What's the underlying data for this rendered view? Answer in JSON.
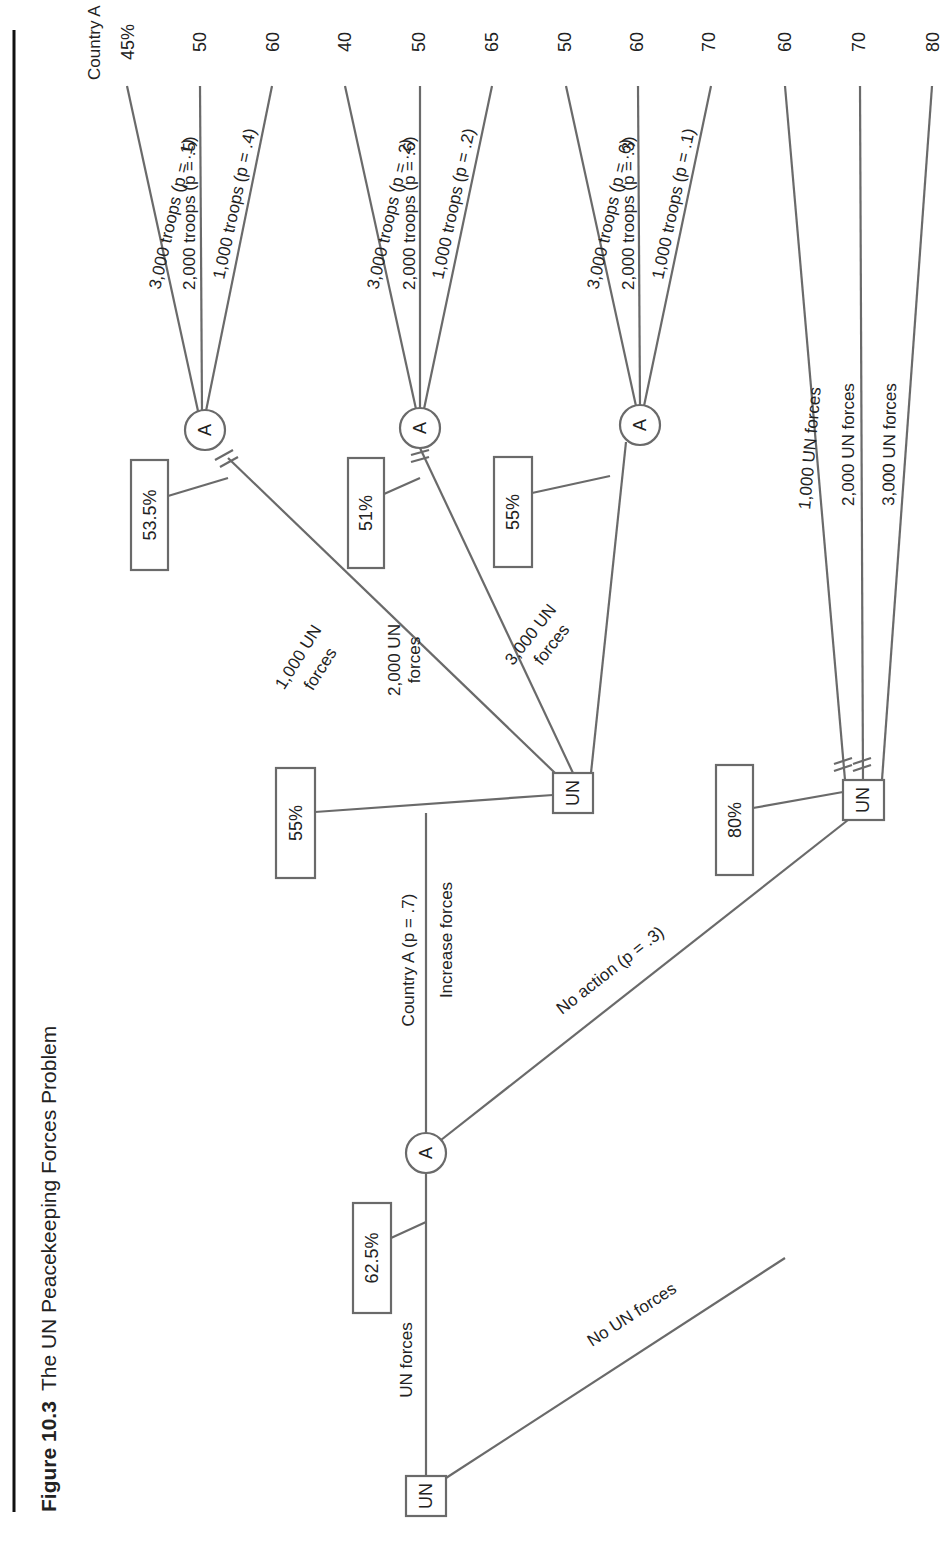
{
  "caption": {
    "figure_number": "Figure 10.3",
    "title": "The UN Peacekeeping Forces Problem"
  },
  "root": {
    "node_label": "UN",
    "value_box": "62.5%",
    "branch_un_forces": "UN forces",
    "branch_no_un_forces": "No UN forces"
  },
  "country_a_node": {
    "node_label": "A",
    "branch_increase_line1": "Country A (p = .7)",
    "branch_increase_line2": "Increase forces",
    "branch_no_action": "No action (p = .3)"
  },
  "un_increase_node": {
    "node_label": "UN",
    "value_box": "55%",
    "branches": [
      {
        "line1": "1,000 UN",
        "line2": "forces"
      },
      {
        "line1": "2,000 UN",
        "line2": "forces"
      },
      {
        "line1": "3,000 UN",
        "line2": "forces"
      }
    ]
  },
  "chance_header": "Country A",
  "chance_nodes": [
    {
      "node_label": "A",
      "value_box": "53.5%",
      "branches": [
        {
          "label": "3,000 troops (p = .1)",
          "payoff": "45%"
        },
        {
          "label": "2,000 troops (p = .5)",
          "payoff": "50"
        },
        {
          "label": "1,000 troops (p = .4)",
          "payoff": "60"
        }
      ]
    },
    {
      "node_label": "A",
      "value_box": "51%",
      "branches": [
        {
          "label": "3,000 troops (p = .2)",
          "payoff": "40"
        },
        {
          "label": "2,000 troops (p = .6)",
          "payoff": "50"
        },
        {
          "label": "1,000 troops (p = .2)",
          "payoff": "65"
        }
      ]
    },
    {
      "node_label": "A",
      "value_box": "55%",
      "branches": [
        {
          "label": "3,000 troops (p = .6)",
          "payoff": "50"
        },
        {
          "label": "2,000 troops (p = .3)",
          "payoff": "60"
        },
        {
          "label": "1,000 troops (p = .1)",
          "payoff": "70"
        }
      ]
    }
  ],
  "un_no_action_node": {
    "node_label": "UN",
    "value_box": "80%",
    "branches": [
      {
        "label": "1,000 UN forces",
        "payoff": "60"
      },
      {
        "label": "2,000 UN forces",
        "payoff": "70"
      },
      {
        "label": "3,000 UN forces",
        "payoff": "80"
      }
    ]
  }
}
